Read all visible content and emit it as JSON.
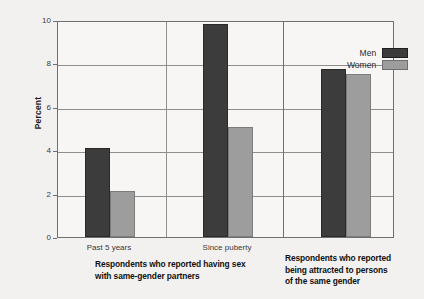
{
  "chart_data": {
    "type": "bar",
    "title": "",
    "xlabel": "",
    "ylabel": "Percent",
    "ylim": [
      0,
      10
    ],
    "yticks": [
      0,
      2,
      4,
      6,
      8,
      10
    ],
    "ytick_labels": [
      "0",
      "2",
      "4",
      "6",
      "8",
      "10"
    ],
    "grid": true,
    "legend_position": "top-right",
    "categories": [
      "Past 5 years",
      "Since puberty",
      ""
    ],
    "series": [
      {
        "name": "Men",
        "color": "#3c3c3c",
        "values": [
          4.1,
          9.8,
          7.75
        ]
      },
      {
        "name": "Women",
        "color": "#9d9d9d",
        "values": [
          2.1,
          5.05,
          7.5
        ]
      }
    ],
    "panels": [
      {
        "caption_lines": [
          "Respondents who reported having sex",
          "with same-gender partners"
        ],
        "categories": [
          "Past 5 years",
          "Since puberty"
        ]
      },
      {
        "caption_lines": [
          "Respondents who reported",
          "being attracted to persons",
          "of the same gender"
        ],
        "categories": [
          ""
        ]
      }
    ]
  },
  "legend": {
    "items": [
      {
        "label": "Men",
        "color": "#3c3c3c"
      },
      {
        "label": "Women",
        "color": "#9d9d9d"
      }
    ]
  },
  "axis": {
    "y_title": "Percent"
  },
  "colors": {
    "men": "#3c3c3c",
    "women": "#9d9d9d",
    "plot_background": "#f7f6f4",
    "page_background": "#f2f1ef",
    "gridline": "#8e8e8e",
    "frame": "#6f6f6f"
  }
}
